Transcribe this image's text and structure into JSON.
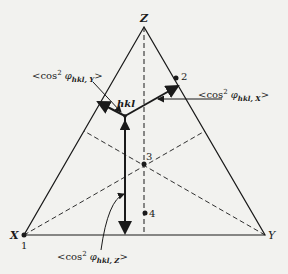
{
  "diagram": {
    "type": "ternary-triangle",
    "vertices": {
      "Z": {
        "label": "Z",
        "x": 144,
        "y": 27
      },
      "X": {
        "label": "X",
        "x": 24,
        "y": 235
      },
      "Y": {
        "label": "Y",
        "x": 265,
        "y": 235
      }
    },
    "points": [
      {
        "id": "1",
        "label": "1",
        "x": 24,
        "y": 235
      },
      {
        "id": "2",
        "label": "2",
        "x": 176,
        "y": 78
      },
      {
        "id": "3",
        "label": "3",
        "x": 144,
        "y": 164
      },
      {
        "id": "4",
        "label": "4",
        "x": 145,
        "y": 213
      }
    ],
    "hkl": {
      "label": "hkl",
      "x": 125,
      "y": 116
    },
    "annotations": {
      "cos_y": {
        "prefix": "<cos",
        "sup": "2",
        "phi": " φ",
        "sub": "hkl, Y",
        "suffix": ">"
      },
      "cos_x": {
        "prefix": "<cos",
        "sup": "2",
        "phi": " φ",
        "sub": "hkl, X",
        "suffix": ">"
      },
      "cos_z": {
        "prefix": "<cos",
        "sup": "2",
        "phi": " φ",
        "sub": "hkl, Z",
        "suffix": ">"
      }
    },
    "colors": {
      "line": "#1a1a1a",
      "background": "#f2f2ef"
    }
  }
}
